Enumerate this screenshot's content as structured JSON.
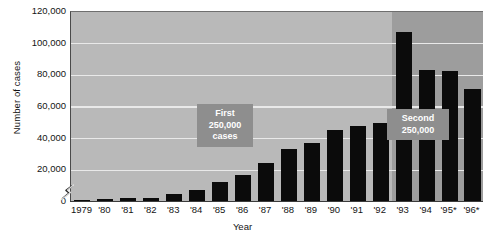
{
  "chart_data": {
    "type": "bar",
    "title": "",
    "xlabel": "Year",
    "ylabel": "Number of cases",
    "ylim": [
      0,
      120000
    ],
    "ytick_values": [
      0,
      20000,
      40000,
      60000,
      80000,
      100000,
      120000
    ],
    "ytick_labels": [
      "0",
      "20,000",
      "40,000",
      "60,000",
      "80,000",
      "100,000",
      "120,000"
    ],
    "grid": true,
    "grid_axis": "y",
    "grid_color": "#e9e9e9",
    "legend": "none",
    "axis_break": true,
    "axis_break_note": "zigzag break on y-axis just above 0",
    "plot_background": "#b9b9b9",
    "shaded_band_color": "#9d9d9d",
    "shaded_band_start_category": "'93",
    "bar_color": "#0b0b0b",
    "categories": [
      "1979",
      "'80",
      "'81",
      "'82",
      "'83",
      "'84",
      "'85",
      "'86",
      "'87",
      "'88",
      "'89",
      "'90",
      "'91",
      "'92",
      "'93",
      "'94",
      "'95*",
      "'96*"
    ],
    "values": [
      300,
      1200,
      1600,
      2100,
      4500,
      6800,
      12000,
      16500,
      24000,
      33000,
      36500,
      45000,
      47500,
      49500,
      107000,
      82500,
      82000,
      71000
    ],
    "annotations": [
      {
        "name": "first-250k",
        "text": "First\n250,000\ncases"
      },
      {
        "name": "second-250k",
        "text": "Second\n250,000"
      }
    ]
  },
  "axes": {
    "y_title": "Number of cases",
    "x_title": "Year"
  }
}
